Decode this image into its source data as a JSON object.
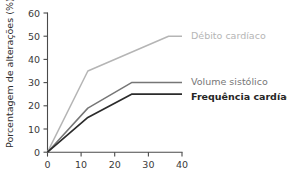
{
  "chart_data": {
    "type": "line",
    "title": "",
    "xlabel": "",
    "ylabel": "Porcentagem de alterações (%)",
    "xlim": [
      0,
      42
    ],
    "ylim": [
      0,
      60
    ],
    "xticks": [
      0,
      10,
      20,
      30,
      40
    ],
    "yticks": [
      0,
      10,
      20,
      30,
      40,
      50,
      60
    ],
    "xtick_labels": [
      "0",
      "10",
      "20",
      "30",
      "40"
    ],
    "ytick_labels": [
      "0",
      "10",
      "20",
      "30",
      "40",
      "50",
      "60"
    ],
    "grid": false,
    "legend_position": "right-inline",
    "series": [
      {
        "name": "Débito cardíaco",
        "color": "#b5b5b5",
        "x": [
          0,
          12,
          36,
          40
        ],
        "values": [
          0,
          35,
          50,
          50
        ]
      },
      {
        "name": "Volume sistólico",
        "color": "#767676",
        "x": [
          0,
          12,
          25,
          40
        ],
        "values": [
          0,
          19,
          30,
          30
        ]
      },
      {
        "name": "Frequência cardíaca",
        "color": "#2b2b2b",
        "x": [
          0,
          12,
          25,
          40
        ],
        "values": [
          0,
          15,
          25,
          25
        ]
      }
    ]
  },
  "labels": {
    "series_0": "Débito cardíaco",
    "series_1": "Volume sistólico",
    "series_2": "Frequência cardíaca",
    "y_axis_title": "Porcentagem de alterações (%)",
    "y_0": "0",
    "y_10": "10",
    "y_20": "20",
    "y_30": "30",
    "y_40": "40",
    "y_50": "50",
    "y_60": "60",
    "x_0": "0",
    "x_10": "10",
    "x_20": "20",
    "x_30": "30",
    "x_40": "40"
  }
}
